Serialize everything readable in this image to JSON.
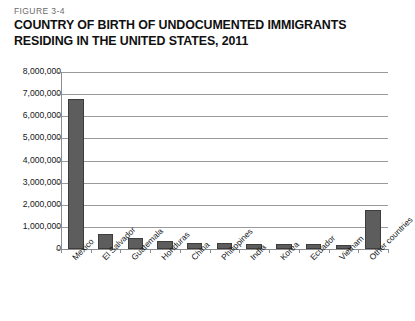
{
  "figure": {
    "number_label": "FIGURE 3-4",
    "title_line1": "COUNTRY OF BIRTH OF UNDOCUMENTED IMMIGRANTS",
    "title_line2": "RESIDING IN THE UNITED STATES, 2011"
  },
  "colors": {
    "bar_fill": "#5d5d5d",
    "bar_stroke": "#3d3d3d",
    "gridline": "#9a9a9a",
    "axis": "#8d8d8d",
    "text": "#15181a",
    "background": "#ffffff"
  },
  "chart_data": {
    "type": "bar",
    "title": "COUNTRY OF BIRTH OF UNDOCUMENTED IMMIGRANTS RESIDING IN THE UNITED STATES, 2011",
    "xlabel": "",
    "ylabel": "",
    "ylim": [
      0,
      8000000
    ],
    "ytick_values": [
      0,
      1000000,
      2000000,
      3000000,
      4000000,
      5000000,
      6000000,
      7000000,
      8000000
    ],
    "ytick_labels": [
      "0",
      "1,000,000",
      "2,000,000",
      "3,000,000",
      "4,000,000",
      "5,000,000",
      "6,000,000",
      "7,000,000",
      "8,000,000"
    ],
    "grid": true,
    "legend": false,
    "categories": [
      "Mexico",
      "El Salvador",
      "Guatemala",
      "Honduras",
      "China",
      "Philippines",
      "India",
      "Korea",
      "Ecuador",
      "Vietnam",
      "Other countries"
    ],
    "values": [
      6800000,
      660000,
      520000,
      380000,
      280000,
      270000,
      240000,
      230000,
      210000,
      170000,
      1750000
    ]
  }
}
